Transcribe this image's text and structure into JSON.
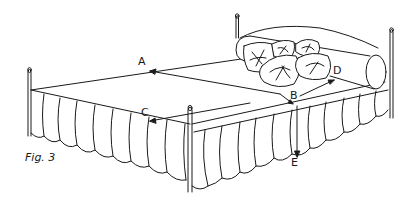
{
  "figure": {
    "caption": "Fig. 3",
    "labels": {
      "A": "A",
      "B": "B",
      "C": "C",
      "D": "D",
      "E": "E"
    },
    "measurements": [
      {
        "label": "A",
        "description": "arrow pointing across top of box spring toward head-end left"
      },
      {
        "label": "B",
        "description": "front-right corner reference point of box spring"
      },
      {
        "label": "C",
        "description": "arrow along foot edge toward left"
      },
      {
        "label": "D",
        "description": "arrow along right side toward head"
      },
      {
        "label": "E",
        "description": "vertical drop from box spring top to floor"
      }
    ]
  },
  "colors": {
    "line": "#1a1a1a",
    "background": "#ffffff",
    "fill": "#ffffff"
  }
}
